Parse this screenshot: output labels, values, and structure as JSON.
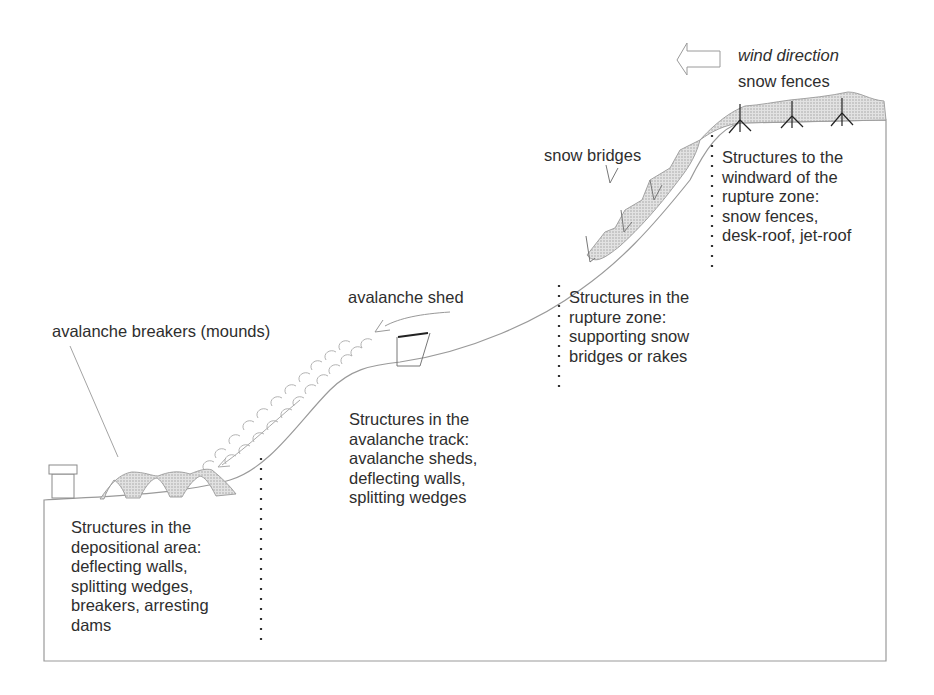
{
  "labels": {
    "wind_direction": "wind direction",
    "snow_fences": "snow fences",
    "snow_bridges": "snow bridges",
    "avalanche_shed": "avalanche shed",
    "avalanche_breakers": "avalanche breakers (mounds)"
  },
  "zones": {
    "windward": {
      "lines": [
        "Structures to the",
        "windward of the",
        "rupture zone:",
        "snow fences,",
        "desk-roof, jet-roof"
      ]
    },
    "rupture": {
      "lines": [
        "Structures in the",
        "rupture zone:",
        "supporting snow",
        "bridges or rakes"
      ]
    },
    "track": {
      "lines": [
        "Structures in the",
        "avalanche track:",
        "avalanche sheds,",
        "deflecting walls,",
        "splitting wedges"
      ]
    },
    "depositional": {
      "lines": [
        "Structures in the",
        "depositional area:",
        "deflecting walls,",
        "splitting wedges,",
        "breakers, arresting",
        "dams"
      ]
    }
  },
  "icons": {
    "wind_arrow": "arrow-left-outline",
    "snow_fence": "fence-tripod",
    "house": "building"
  },
  "colors": {
    "line": "#8a8a8a",
    "text": "#2e2e2e",
    "hatch": "#c8c8c8",
    "dots": "#333333"
  }
}
